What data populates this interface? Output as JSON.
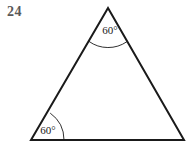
{
  "figure": {
    "problem_number": "24",
    "background_color": "#ffffff",
    "stroke_color": "#1a1a1a",
    "label_color": "#595959",
    "angle_text_color": "#1a1a1a",
    "shape": "triangle",
    "vertices": {
      "apex": {
        "x": 108,
        "y": 8
      },
      "bottom_left": {
        "x": 31,
        "y": 140
      },
      "bottom_right": {
        "x": 184,
        "y": 140
      }
    },
    "angles": [
      {
        "name": "apex-angle",
        "label": "60°",
        "vertex": "apex",
        "label_x": 110,
        "label_y": 34,
        "arc_radius": 33
      },
      {
        "name": "bottom-left-angle",
        "label": "60°",
        "vertex": "bottom_left",
        "label_x": 48,
        "label_y": 134,
        "arc_radius": 33
      }
    ],
    "edges": [
      {
        "name": "left-side",
        "from": "bottom_left",
        "to": "apex"
      },
      {
        "name": "right-side",
        "from": "apex",
        "to": "bottom_right"
      },
      {
        "name": "base",
        "from": "bottom_left",
        "to": "bottom_right"
      }
    ]
  }
}
